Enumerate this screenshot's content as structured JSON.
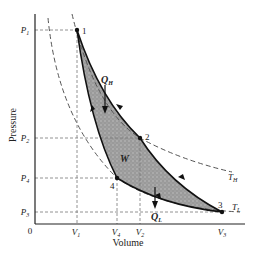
{
  "diagram": {
    "type": "pv-cycle",
    "axes": {
      "xlabel": "Volume",
      "ylabel": "Pressure",
      "origin_label": "0"
    },
    "pressure_ticks": [
      {
        "main": "P",
        "sub": "1",
        "y": 30
      },
      {
        "main": "P",
        "sub": "2",
        "y": 138
      },
      {
        "main": "P",
        "sub": "4",
        "y": 178
      },
      {
        "main": "P",
        "sub": "3",
        "y": 212
      }
    ],
    "volume_ticks": [
      {
        "main": "V",
        "sub": "1",
        "x": 77
      },
      {
        "main": "V",
        "sub": "4",
        "x": 117
      },
      {
        "main": "V",
        "sub": "2",
        "x": 140
      },
      {
        "main": "V",
        "sub": "3",
        "x": 222
      }
    ],
    "points": [
      {
        "label": "1",
        "x": 77,
        "y": 30
      },
      {
        "label": "2",
        "x": 140,
        "y": 138
      },
      {
        "label": "3",
        "x": 222,
        "y": 212
      },
      {
        "label": "4",
        "x": 117,
        "y": 178
      }
    ],
    "isotherms": [
      {
        "main": "T",
        "sub": "H"
      },
      {
        "main": "T",
        "sub": "L"
      }
    ],
    "annotations": {
      "heat_in": {
        "main": "Q",
        "sub": "H"
      },
      "heat_out": {
        "main": "Q",
        "sub": "L"
      },
      "work": "W"
    },
    "colors": {
      "fill": "#9a9a9a",
      "line": "#111111",
      "dash": "#555555"
    }
  }
}
